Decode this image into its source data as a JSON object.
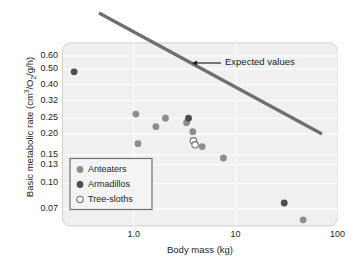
{
  "chart_data": {
    "type": "scatter",
    "title": "",
    "xlabel": "Body mass (kg)",
    "ylabel": "Basic metabolic rate (cm3/O2/g/h)",
    "ylabel_parts": {
      "prefix": "Basic metabolic rate (cm",
      "sup": "3",
      "mid": "/O",
      "sub": "2",
      "suffix": "/g/h)"
    },
    "xscale": "log",
    "yscale": "log",
    "xlim": [
      0.2,
      100
    ],
    "ylim": [
      0.055,
      0.72
    ],
    "xticks": [
      "1.0",
      "10",
      "100"
    ],
    "xtick_values": [
      1.0,
      10,
      100
    ],
    "yticks": [
      "0.60",
      "0.50",
      "0.40",
      "0.32",
      "0.25",
      "0.20",
      "0.15",
      "0.13",
      "0.10",
      "0.07"
    ],
    "ytick_values": [
      0.6,
      0.5,
      0.4,
      0.32,
      0.25,
      0.2,
      0.15,
      0.13,
      0.1,
      0.07
    ],
    "grid": true,
    "grid_color": "#d7d7d7",
    "plot_bg": "#f0f0f0",
    "legend_position": "lower-left",
    "annotations": [
      {
        "text": "Expected values",
        "arrow": "left",
        "x_px": 225,
        "y_px": 63,
        "arrow_tip_x_px": 192,
        "arrow_tail_x_px": 221
      }
    ],
    "reference_line": {
      "label": "Expected values",
      "color": "#6f6f6f",
      "width_px": 3.2,
      "x1_px": 99,
      "y1_px": 13,
      "x2_px": 322,
      "y2_px": 134
    },
    "series": [
      {
        "name": "Anteaters",
        "marker": "filled-circle",
        "color": "#8d8d8d",
        "points": [
          {
            "x": 1.05,
            "y": 0.265
          },
          {
            "x": 1.1,
            "y": 0.175
          },
          {
            "x": 1.65,
            "y": 0.222
          },
          {
            "x": 2.05,
            "y": 0.25
          },
          {
            "x": 3.3,
            "y": 0.235
          },
          {
            "x": 3.8,
            "y": 0.207
          },
          {
            "x": 4.7,
            "y": 0.168
          },
          {
            "x": 7.6,
            "y": 0.143
          },
          {
            "x": 46.0,
            "y": 0.06
          }
        ]
      },
      {
        "name": "Armadillos",
        "marker": "filled-circle",
        "color": "#4d4d4d",
        "points": [
          {
            "x": 0.26,
            "y": 0.48
          },
          {
            "x": 3.45,
            "y": 0.25
          },
          {
            "x": 30.0,
            "y": 0.076
          }
        ]
      },
      {
        "name": "Tree-sloths",
        "marker": "open-circle",
        "color": "#ffffff",
        "edge_color": "#6f6f6f",
        "points": [
          {
            "x": 3.85,
            "y": 0.182
          },
          {
            "x": 4.0,
            "y": 0.172
          }
        ]
      }
    ]
  },
  "legend": {
    "items": [
      {
        "label": "Anteaters",
        "marker": "filled-circle",
        "color": "#8d8d8d"
      },
      {
        "label": "Armadillos",
        "marker": "filled-circle",
        "color": "#4d4d4d"
      },
      {
        "label": "Tree-sloths",
        "marker": "open-circle",
        "color": "#ffffff"
      }
    ]
  }
}
